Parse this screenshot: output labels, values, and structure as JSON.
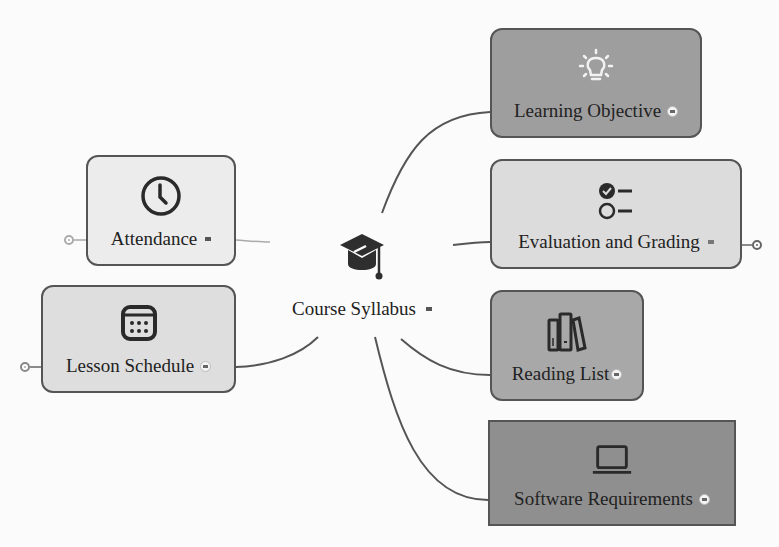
{
  "central_topic": {
    "label": "Course Syllabus",
    "icon": "graduation-cap-icon"
  },
  "branches": [
    {
      "id": "learning-objective",
      "label": "Learning Objective",
      "icon": "lightbulb-icon",
      "fill": "#9e9e9e",
      "side": "right"
    },
    {
      "id": "evaluation-and-grading",
      "label": "Evaluation and Grading",
      "icon": "checklist-icon",
      "fill": "#dcdcdc",
      "side": "right",
      "collapsible": true
    },
    {
      "id": "reading-list",
      "label": "Reading List",
      "icon": "books-icon",
      "fill": "#a8a8a8",
      "side": "right"
    },
    {
      "id": "software-requirements",
      "label": "Software Requirements",
      "icon": "laptop-icon",
      "fill": "#8f8f8f",
      "side": "right"
    },
    {
      "id": "attendance",
      "label": "Attendance",
      "icon": "clock-icon",
      "fill": "#ececec",
      "side": "left",
      "collapsible": true
    },
    {
      "id": "lesson-schedule",
      "label": "Lesson Schedule",
      "icon": "calendar-icon",
      "fill": "#dedede",
      "side": "left",
      "collapsible": true
    }
  ],
  "colors": {
    "connector": "#555555",
    "faint_connector": "#aaaaaa",
    "border": "#555555"
  }
}
